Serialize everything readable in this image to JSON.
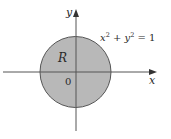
{
  "diagram": {
    "type": "region-plot",
    "region_label": "R",
    "origin_label": "0",
    "x_axis_label": "x",
    "y_axis_label": "y",
    "equation": {
      "lhs_x": "x",
      "lhs_exp1": "2",
      "plus": " + ",
      "lhs_y": "y",
      "lhs_exp2": "2",
      "rhs": " = 1"
    },
    "circle": {
      "center": [
        0,
        0
      ],
      "radius": 1
    },
    "colors": {
      "fill": "#b8b8b8",
      "stroke": "#555555",
      "axis": "#555555",
      "background": "#ffffff"
    }
  }
}
